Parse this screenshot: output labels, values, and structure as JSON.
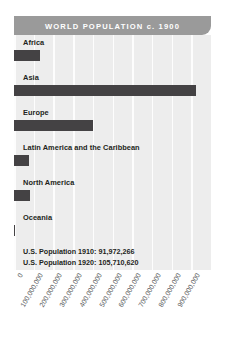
{
  "chart_data": {
    "type": "bar",
    "title": "WORLD POPULATION c. 1900",
    "orientation": "horizontal",
    "xlabel": "",
    "ylabel": "",
    "xlim": [
      0,
      1000000000
    ],
    "grid": true,
    "legend": "none",
    "categories": [
      "Africa",
      "Asia",
      "Europe",
      "Latin America and the Caribbean",
      "North America",
      "Oceania"
    ],
    "values": [
      133000000,
      925000000,
      400000000,
      74000000,
      82000000,
      6000000
    ],
    "tick_labels": [
      "0",
      "100,000,000",
      "200,000,000",
      "300,000,000",
      "400,000,000",
      "500,000,000",
      "600,000,000",
      "700,000,000",
      "800,000,000",
      "900,000,000"
    ],
    "tick_values": [
      0,
      100000000,
      200000000,
      300000000,
      400000000,
      500000000,
      600000000,
      700000000,
      800000000,
      900000000
    ],
    "annotations": [
      "U.S. Population 1910: 91,972,266",
      "U.S. Population 1920: 105,710,620"
    ],
    "colors": {
      "bar": "#444244",
      "title_bar": "#9a9a9a",
      "title_text": "#ffffff",
      "plot_background": "#ededed",
      "gridline": "#fdfdfd",
      "label_text": "#231f20",
      "tick_text": "#58595b"
    }
  }
}
